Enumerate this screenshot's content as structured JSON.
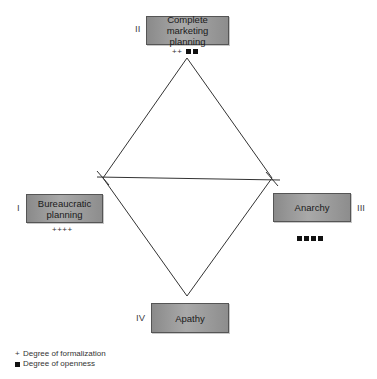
{
  "diagram": {
    "quadrants": [
      {
        "id": "II",
        "numeral": "II",
        "label": "Complete marketing planning",
        "label_line1": "Complete marketing",
        "label_line2": "planning",
        "formalization_marks": "++",
        "openness_marks": 2
      },
      {
        "id": "I",
        "numeral": "I",
        "label": "Bureaucratic planning",
        "label_line1": "Bureaucratic",
        "label_line2": "planning",
        "formalization_marks": "++++",
        "openness_marks": 0
      },
      {
        "id": "III",
        "numeral": "III",
        "label": "Anarchy",
        "label_line1": "Anarchy",
        "label_line2": "",
        "formalization_marks": "",
        "openness_marks": 4
      },
      {
        "id": "IV",
        "numeral": "IV",
        "label": "Apathy",
        "label_line1": "Apathy",
        "label_line2": "",
        "formalization_marks": "",
        "openness_marks": 0
      }
    ],
    "legend": {
      "formalization_symbol": "+",
      "formalization_label": "Degree of formalization",
      "openness_symbol": "■",
      "openness_label": "Degree of openness"
    },
    "colors": {
      "box_fill": "#9a9a9a",
      "box_border": "#555555",
      "line": "#333333",
      "text": "#1a1a1a"
    }
  }
}
